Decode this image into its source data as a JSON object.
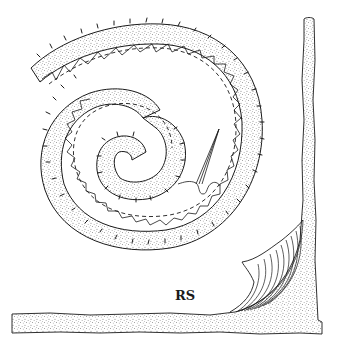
{
  "figure": {
    "label": "RS",
    "label_position": {
      "x": 175,
      "y": 289
    },
    "colors": {
      "ink": "#1a1a1a",
      "stipple": "#2a2a2a",
      "background": "#ffffff"
    },
    "elements": [
      {
        "name": "spiral-band",
        "description": "stippled coiled band with outward spines and inner notched (crenellated) margin"
      },
      {
        "name": "dashed-guide-line",
        "description": "dashed spiral line running inside the band"
      },
      {
        "name": "needle-tip",
        "description": "slender pointed needle-like structure near spiral center with wavy thread"
      },
      {
        "name": "corner-wall",
        "description": "stippled L-shaped wall along right and bottom edges"
      },
      {
        "name": "fibrous-fillet",
        "description": "striated fan-shaped structure filling the inside corner of the wall"
      }
    ]
  }
}
